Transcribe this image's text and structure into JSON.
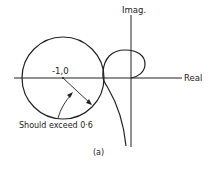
{
  "diagram": {
    "axes": {
      "imag_label": "Imag.",
      "real_label": "Real"
    },
    "point_label": "-1,0",
    "annotation": "Should exceed 0·6",
    "caption": "(a)",
    "colors": {
      "line": "#222222",
      "background": "#ffffff"
    }
  }
}
